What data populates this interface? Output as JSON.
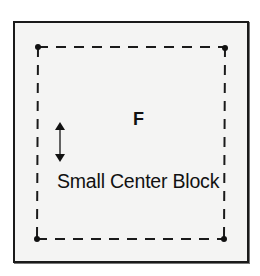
{
  "diagram": {
    "frame_label": "F",
    "block_label": "Small Center Block",
    "colors": {
      "background": "#ffffff",
      "frame_fill": "#f4f4f3",
      "stroke": "#1a1a1a"
    },
    "corner_points": [
      {
        "name": "top-left",
        "x": 38,
        "y": 47
      },
      {
        "name": "top-right",
        "x": 225,
        "y": 47
      },
      {
        "name": "bottom-left",
        "x": 37,
        "y": 239
      },
      {
        "name": "bottom-right",
        "x": 224,
        "y": 239
      }
    ],
    "icons": {
      "vertical_resize": "double-headed-vertical-arrow"
    }
  }
}
